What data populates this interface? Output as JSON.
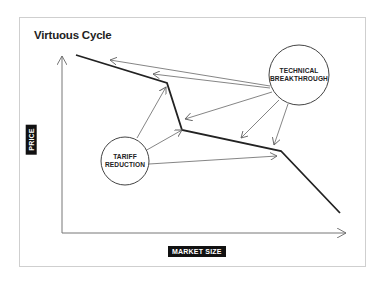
{
  "title": "Virtuous Cycle",
  "axes": {
    "y_label": "PRICE",
    "x_label": "MARKET SIZE"
  },
  "nodes": {
    "technical": {
      "line1": "TECHNICAL",
      "line2": "BREAKTHROUGH"
    },
    "tariff": {
      "line1": "TARIFF",
      "line2": "REDUCTION"
    }
  },
  "colors": {
    "curve": "#222222",
    "arrows": "#666666",
    "frame": "#cfcfcf",
    "label_bg": "#111111",
    "label_text": "#ffffff"
  }
}
